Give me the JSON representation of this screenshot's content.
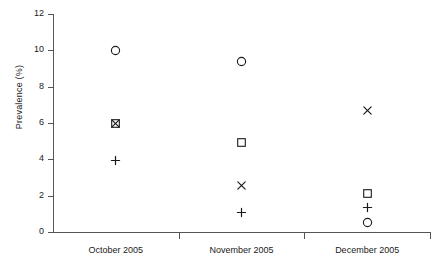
{
  "chart_data": {
    "type": "scatter",
    "title": "",
    "xlabel": "",
    "ylabel": "Prevalence (%)",
    "ylim": [
      0,
      12
    ],
    "yticks": [
      0,
      2,
      4,
      6,
      8,
      10,
      12
    ],
    "grid": false,
    "legend": "none",
    "categories": [
      "October 2005",
      "November 2005",
      "December 2005"
    ],
    "series": [
      {
        "name": "circle",
        "marker": "circle",
        "values": [
          10.0,
          9.4,
          0.55
        ]
      },
      {
        "name": "square",
        "marker": "square",
        "values": [
          6.0,
          4.9,
          2.1
        ]
      },
      {
        "name": "cross",
        "marker": "x",
        "values": [
          6.0,
          2.55,
          6.7
        ]
      },
      {
        "name": "plus",
        "marker": "plus",
        "values": [
          3.95,
          1.1,
          1.35
        ]
      }
    ],
    "points": [
      {
        "category": "October 2005",
        "marker": "circle",
        "value": 10.0
      },
      {
        "category": "October 2005",
        "marker": "square",
        "value": 6.0
      },
      {
        "category": "October 2005",
        "marker": "x",
        "value": 6.0
      },
      {
        "category": "October 2005",
        "marker": "plus",
        "value": 3.95
      },
      {
        "category": "November 2005",
        "marker": "circle",
        "value": 9.4
      },
      {
        "category": "November 2005",
        "marker": "square",
        "value": 4.9
      },
      {
        "category": "November 2005",
        "marker": "x",
        "value": 2.55
      },
      {
        "category": "November 2005",
        "marker": "plus",
        "value": 1.1
      },
      {
        "category": "December 2005",
        "marker": "x",
        "value": 6.7
      },
      {
        "category": "December 2005",
        "marker": "square",
        "value": 2.1
      },
      {
        "category": "December 2005",
        "marker": "plus",
        "value": 1.35
      },
      {
        "category": "December 2005",
        "marker": "circle",
        "value": 0.55
      }
    ],
    "colors": {
      "marker": "#1a1a1a",
      "axis": "#555555",
      "background": "#ffffff"
    }
  },
  "axis": {
    "y_title": "Prevalence (%)",
    "y_tick_labels": [
      "0",
      "2",
      "4",
      "6",
      "8",
      "10",
      "12"
    ],
    "x_tick_labels": [
      "October 2005",
      "November 2005",
      "December 2005"
    ]
  }
}
